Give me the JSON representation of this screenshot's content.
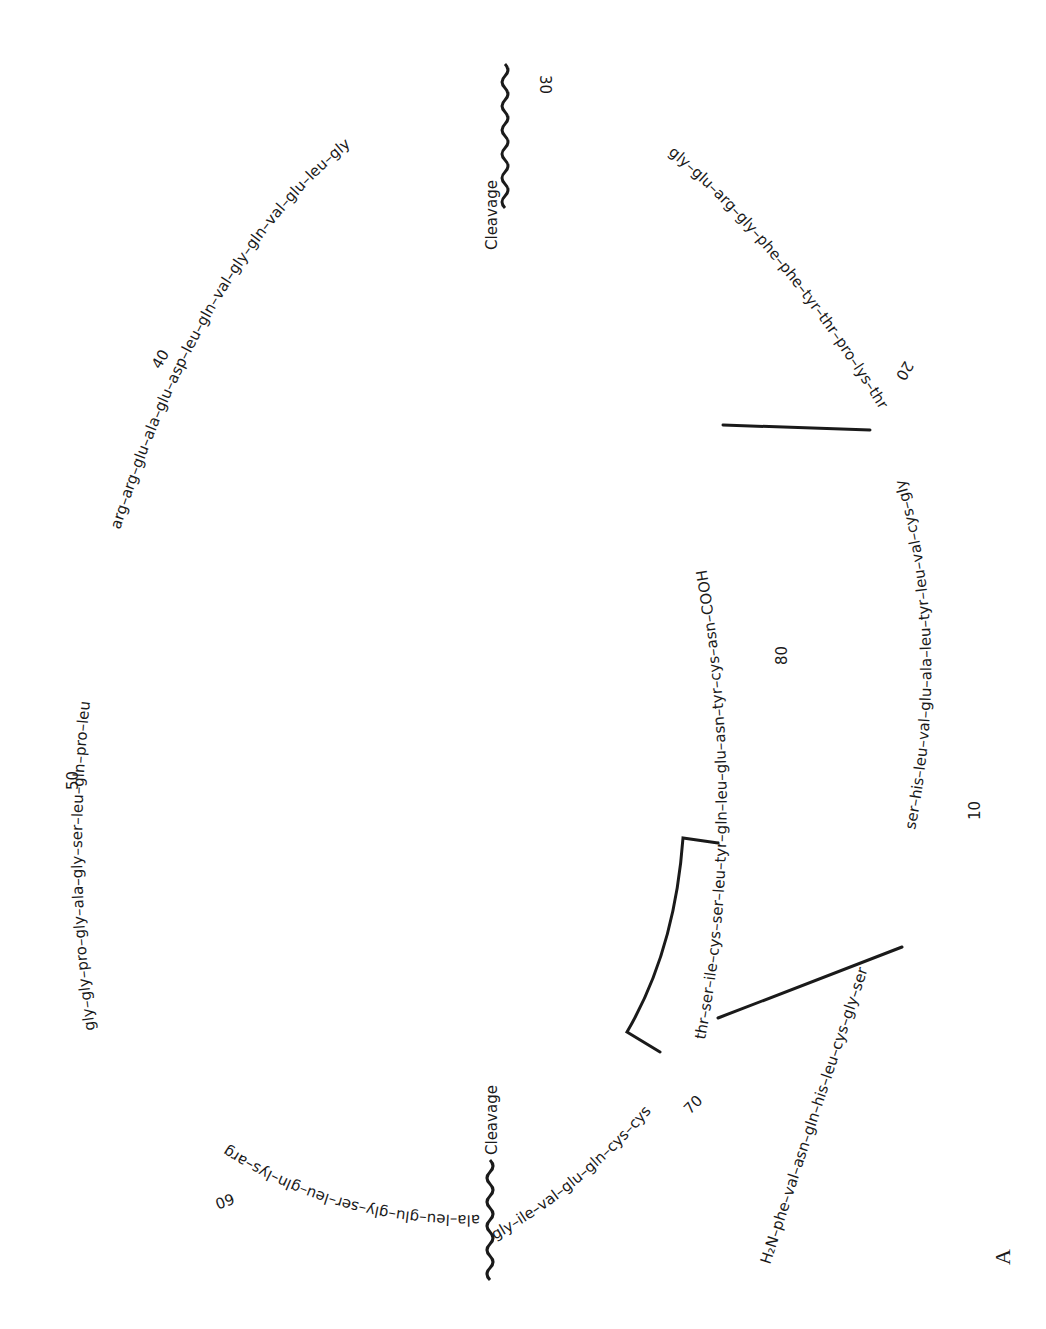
{
  "figure": {
    "panel_label": "A",
    "orientation": "rotated 90° clockwise on page"
  },
  "segments": {
    "b_chain": {
      "text": "H₂N–phe–val–asn–gln–his–leu–cys–gly–ser–his–leu–val–glu–ala–leu–tyr–leu–val–cys–gly–glu–arg–gly–phe–phe–tyr–thr–pro–lys–thr",
      "part1": "H₂N–phe–val–asn–gln–his–leu–cys–gly–ser–his–leu–val–glu–ala–leu–tyr–leu–val–cys–gly",
      "part2": "glu–arg–gly–phe–phe–tyr–thr–pro–lys–thr"
    },
    "c_peptide": {
      "part1": "arg–arg–glu–ala–glu–asp–leu–gln–val–gly–gln–val–glu–leu–gly–gly–gly–pro–gly–ala–gly–ser–leu–gln–pro–leu–ala–leu–glu–gly–ser–leu–gln–lys–arg"
    },
    "a_chain": {
      "text": "gly–ile–val–glu–gln–cys–cys–thr–ser–ile–cys–ser–leu–tyr–gln–leu–glu–asn–tyr–cys–asn–COOH"
    }
  },
  "residue_numbers": [
    {
      "label": "10",
      "position": "B chain near his-10"
    },
    {
      "label": "20",
      "position": "B chain near gly-20"
    },
    {
      "label": "30",
      "position": "B chain terminal thr-30"
    },
    {
      "label": "40",
      "position": "C peptide"
    },
    {
      "label": "50",
      "position": "C peptide"
    },
    {
      "label": "60",
      "position": "C peptide"
    },
    {
      "label": "70",
      "position": "A chain near gln"
    },
    {
      "label": "80",
      "position": "A chain near gln"
    }
  ],
  "cleavage_sites": [
    {
      "label": "Cleavage",
      "between": "thr-30 / arg-31"
    },
    {
      "label": "Cleavage",
      "between": "arg / gly (A1)"
    }
  ],
  "disulfide_bonds": [
    {
      "from": "B chain cys-7",
      "to": "A chain cys-7"
    },
    {
      "from": "B chain cys-19",
      "to": "A chain cys-20"
    },
    {
      "from": "A chain cys-6",
      "to": "A chain cys-11",
      "type": "intrachain bracket"
    }
  ],
  "labels": {
    "n_terminus": "H₂N",
    "c_terminus": "COOH",
    "cleavage_top": "Cleavage",
    "cleavage_bottom": "Cleavage",
    "n10": "10",
    "n20": "20",
    "n30": "30",
    "n40": "40",
    "n50": "50",
    "n60": "60",
    "n70": "70",
    "n80": "80",
    "panel": "A"
  },
  "text_runs": {
    "b1": "H₂N–phe–val–asn–gln–his–leu–cys–gly–ser",
    "b2": "ser–his–leu–val–glu–ala–leu–tyr–leu–val–cys–gly",
    "b3": "gly–glu–arg–gly–phe–phe–tyr–thr–pro–lys–thr",
    "c1": "arg–arg–glu–ala–glu–asp–leu–gln–val–gly–gln–val–glu–leu–gly",
    "c2": "gly–gly–pro–gly–ala–gly–ser–leu–gln–pro–leu",
    "c3": "ala–leu–glu–gly–ser–leu–gln–lys–arg",
    "a1": "gly–ile–val–glu–gln–cys–cys",
    "a2": "thr–ser–ile–cys–ser–leu–tyr–gln–leu–glu–asn–tyr–cys–asn–COOH"
  }
}
